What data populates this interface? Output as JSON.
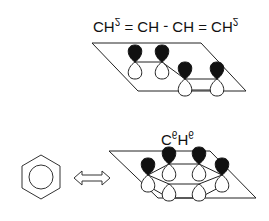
{
  "diagram": {
    "orientation": "flipped-vertically",
    "butadiene": {
      "formula_parts": [
        "CH",
        "2",
        " = CH - CH = CH",
        "2"
      ],
      "label": "CH2 = CH - CH = CH2",
      "p_orbital_count": 4
    },
    "benzene": {
      "formula_parts": [
        "C",
        "6",
        "H",
        "6"
      ],
      "label": "C6H6",
      "p_orbital_count": 6,
      "resonance_symbol": "hexagon-with-circle",
      "arrow": "double-headed-arrow"
    },
    "colors": {
      "line": "#222222",
      "lobe_filled": "#111111",
      "lobe_empty": "#ffffff",
      "background": "#ffffff"
    }
  }
}
